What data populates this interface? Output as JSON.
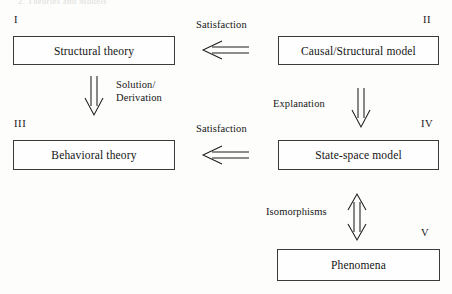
{
  "figure": {
    "running_head": "2.  Theories and Models",
    "boxes": [
      {
        "numeral": "I",
        "label": "Structural theory"
      },
      {
        "numeral": "II",
        "label": "Causal/Structural model"
      },
      {
        "numeral": "III",
        "label": "Behavioral theory"
      },
      {
        "numeral": "IV",
        "label": "State-space model"
      },
      {
        "numeral": "V",
        "label": "Phenomena"
      }
    ],
    "edges": [
      {
        "label": "Satisfaction",
        "arrow": "double-left-arrow-icon",
        "from": "II",
        "to": "I"
      },
      {
        "label": "Solution/\nDerivation",
        "line1": "Solution/",
        "line2": "Derivation",
        "arrow": "double-down-arrow-icon",
        "from": "I",
        "to": "III"
      },
      {
        "label": "Explanation",
        "arrow": "double-down-arrow-icon",
        "from": "II",
        "to": "IV"
      },
      {
        "label": "Satisfaction",
        "arrow": "double-left-arrow-icon",
        "from": "IV",
        "to": "III"
      },
      {
        "label": "Isomorphisms",
        "arrow": "double-updown-arrow-icon",
        "from": "IV",
        "to": "V"
      }
    ],
    "colors": {
      "ink": "#161616",
      "box_border": "#3a3a3a",
      "page_background": "#fdfdfc"
    }
  }
}
